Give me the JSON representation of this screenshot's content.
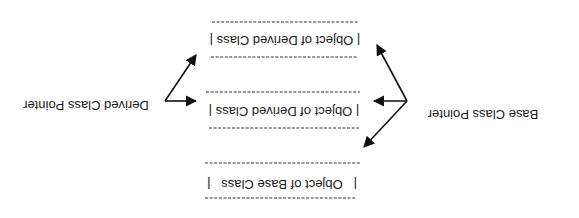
{
  "diagram": {
    "orientation": "rotated 180 degrees",
    "boxes": [
      {
        "label": "| Object of Derived Class |"
      },
      {
        "label": "| Object of Derived Class |"
      },
      {
        "label": "|   Object of Base Class   |"
      }
    ],
    "pointers": {
      "base": {
        "label": "Base Class Pointer",
        "targets": [
          "box-0",
          "box-1",
          "box-2"
        ]
      },
      "derived": {
        "label": "Derived Class Pointer",
        "targets": [
          "box-0",
          "box-1"
        ]
      }
    },
    "colors": {
      "line": "#111111",
      "text": "#1a1a1a",
      "background": "#ffffff"
    }
  }
}
